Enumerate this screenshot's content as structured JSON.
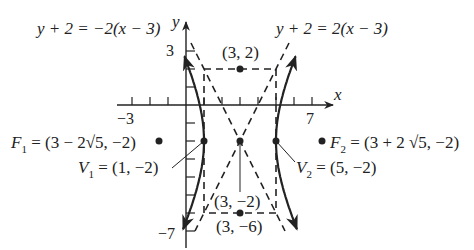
{
  "figure": {
    "type": "hyperbola-graph",
    "equation_context": "horizontal hyperbola centered at (3,-2)",
    "colors": {
      "ink": "#222222",
      "background": "#ffffff"
    }
  },
  "axes": {
    "x_label": "x",
    "y_label": "y",
    "x_tick_labels": [
      {
        "value": -3,
        "text": "−3"
      },
      {
        "value": 7,
        "text": "7"
      }
    ],
    "y_tick_labels": [
      {
        "value": 3,
        "text": "3"
      },
      {
        "value": -7,
        "text": "−7"
      }
    ],
    "x_range": [
      -3,
      7
    ],
    "y_range": [
      -7,
      3
    ]
  },
  "asymptotes": [
    {
      "label": "y + 2 = −2(x − 3)",
      "slope": -2,
      "style": "dashed"
    },
    {
      "label": "y + 2 = 2(x − 3)",
      "slope": 2,
      "style": "dashed"
    }
  ],
  "points": {
    "top": {
      "label": "(3, 2)",
      "x": 3,
      "y": 2
    },
    "center": {
      "label": "(3, −2)",
      "x": 3,
      "y": -2
    },
    "bottom": {
      "label": "(3, −6)",
      "x": 3,
      "y": -6
    },
    "v1": {
      "name": "V",
      "sub": "1",
      "label": " = (1, −2)",
      "x": 1,
      "y": -2
    },
    "v2": {
      "name": "V",
      "sub": "2",
      "label": " = (5, −2)",
      "x": 5,
      "y": -2
    },
    "f1": {
      "name": "F",
      "sub": "1",
      "label": " = (3 − 2√5, −2)",
      "x": -1.472,
      "y": -2
    },
    "f2": {
      "name": "F",
      "sub": "2",
      "label": " = (3 + 2 √5, −2)",
      "x": 7.472,
      "y": -2
    }
  },
  "fundamental_rectangle": {
    "x_min": 1,
    "x_max": 5,
    "y_min": -6,
    "y_max": 2,
    "style": "dashed"
  }
}
